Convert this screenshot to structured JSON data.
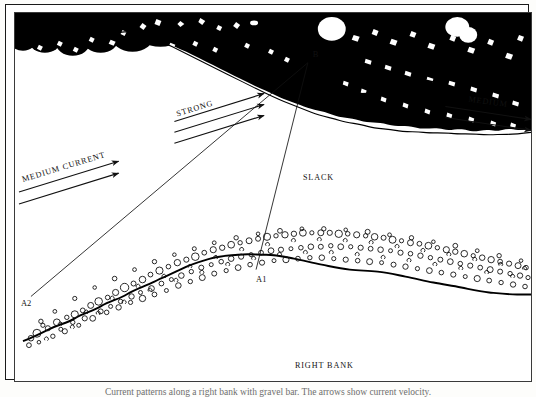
{
  "figure": {
    "caption": "Current patterns along a right bank with gravel bar. The arrows show current velocity.",
    "border_color": "#1a1a1a",
    "ink_color": "#111111",
    "paper_color": "#ffffff"
  },
  "labels": {
    "medium_current": "MEDIUM CURRENT",
    "strong": "STRONG",
    "medium": "MEDIUM",
    "slack": "SLACK",
    "right_bank": "RIGHT BANK",
    "point_b": "B",
    "point_a1": "A1",
    "point_a2": "A2"
  },
  "annotations": {
    "arrow_groups": [
      {
        "name": "medium-current-arrows",
        "label": "MEDIUM CURRENT",
        "count": 2,
        "direction": "right",
        "strength": "medium"
      },
      {
        "name": "strong-arrows",
        "label": "STRONG",
        "count": 3,
        "direction": "right",
        "strength": "strong"
      },
      {
        "name": "eddy-arrows",
        "label": "",
        "count": 3,
        "direction": "left",
        "strength": "reverse"
      },
      {
        "name": "medium-arrows",
        "label": "MEDIUM",
        "count": 2,
        "direction": "right",
        "strength": "medium"
      }
    ],
    "sight_lines": [
      {
        "name": "sight-line-b-a2",
        "from": "B",
        "to": "A2"
      },
      {
        "name": "sight-line-b-a1",
        "from": "B",
        "to": "A1"
      }
    ],
    "regions": [
      {
        "name": "tree-line",
        "label": ""
      },
      {
        "name": "water-surface",
        "label": "SLACK"
      },
      {
        "name": "gravel-bar",
        "label": ""
      },
      {
        "name": "right-bank-ground",
        "label": "RIGHT BANK"
      }
    ]
  }
}
